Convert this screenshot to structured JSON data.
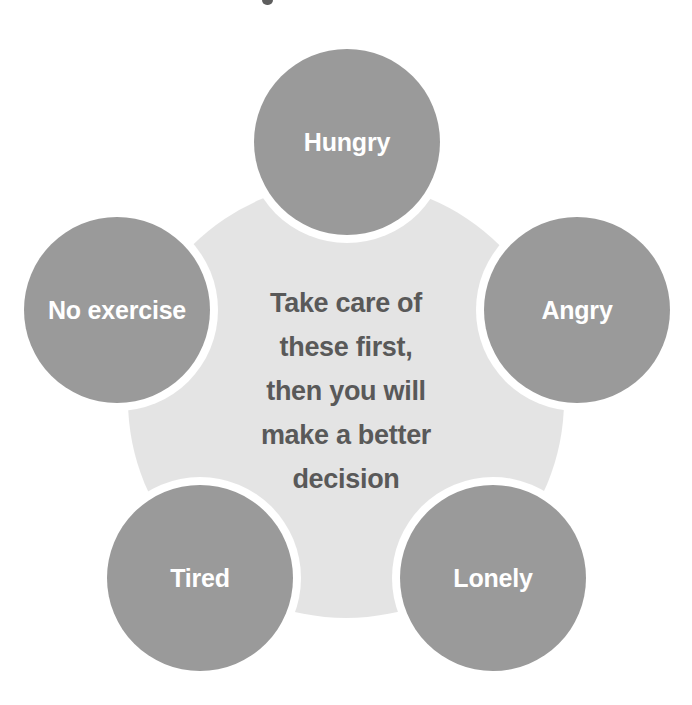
{
  "diagram": {
    "title_fragment_top": "",
    "center": {
      "lines": [
        "Take care of",
        "these first,",
        "then you will",
        "make a better",
        "decision"
      ]
    },
    "nodes": [
      {
        "id": "hungry",
        "label": "Hungry",
        "position": "top",
        "cx": 347,
        "cy": 142,
        "r": 93
      },
      {
        "id": "angry",
        "label": "Angry",
        "position": "right",
        "cx": 577,
        "cy": 310,
        "r": 93
      },
      {
        "id": "lonely",
        "label": "Lonely",
        "position": "bottom-right",
        "cx": 493,
        "cy": 578,
        "r": 93
      },
      {
        "id": "tired",
        "label": "Tired",
        "position": "bottom-left",
        "cx": 200,
        "cy": 578,
        "r": 93
      },
      {
        "id": "no-exercise",
        "label": "No exercise",
        "position": "left",
        "cx": 117,
        "cy": 310,
        "r": 93
      }
    ],
    "hub": {
      "cx": 346,
      "cy": 400,
      "r": 218
    },
    "colors": {
      "node_fill": "#9a9a9a",
      "hub_fill": "#e4e4e4",
      "center_text": "#595959",
      "node_text": "#ffffff",
      "background": "#ffffff",
      "gap_ring": "#ffffff"
    }
  }
}
